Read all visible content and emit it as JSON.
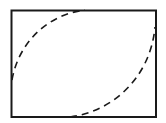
{
  "diagram": {
    "colors": {
      "background": "#ffffff",
      "stroke": "#1a1a1a"
    },
    "elements": [
      {
        "id": "frame",
        "kind": "rectangle",
        "style": "solid"
      },
      {
        "id": "arc-upper-left",
        "kind": "curve",
        "style": "dashed",
        "from": "left-edge",
        "to": "top-edge"
      },
      {
        "id": "arc-lower-right",
        "kind": "curve",
        "style": "dashed",
        "from": "bottom-edge",
        "to": "right-edge"
      }
    ]
  }
}
